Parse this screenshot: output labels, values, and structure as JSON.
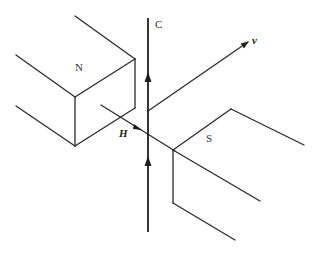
{
  "figure": {
    "labels": {
      "north_pole": "N",
      "south_pole": "S",
      "conductor": "C",
      "velocity": "v",
      "field": "H"
    },
    "colors": {
      "line": "#2a2a2a",
      "background": "#ffffff"
    }
  }
}
